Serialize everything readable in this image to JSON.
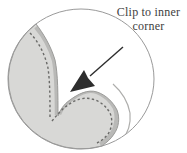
{
  "caption": {
    "line1": "Clip to inner",
    "line2": "corner"
  },
  "colors": {
    "background": "#ffffff",
    "circle_outline": "#9a9a9a",
    "fabric_fill": "#d8d8d6",
    "fabric_edge_outline": "#9c9c9a",
    "seam_allowance_band": "#b9b9b7",
    "stitch_dash": "#6a6a68",
    "under_layer_edge": "#aeaeac",
    "arrow": "#2d2d2d",
    "text": "#3e3e3e"
  },
  "icons": {
    "arrow": "arrow-down-left-icon"
  }
}
